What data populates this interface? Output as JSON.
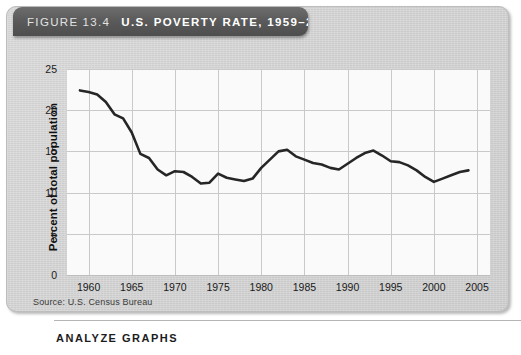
{
  "figure": {
    "label": "FIGURE",
    "number": "13.4",
    "title": "U.S. POVERTY RATE, 1959–2004",
    "source": "Source: U.S. Census Bureau"
  },
  "bottom": {
    "analyze_heading": "ANALYZE GRAPHS"
  },
  "colors": {
    "panel_background": "#d2d2d2",
    "banner_background": "#5b5b5b",
    "plot_background": "#fafafa",
    "grid_line": "#c9c9c9",
    "data_line": "#262626",
    "text": "#1a1a1a"
  },
  "chart_data": {
    "type": "line",
    "title": "U.S. POVERTY RATE, 1959–2004",
    "xlabel": "",
    "ylabel": "Percent of total population",
    "xlim": [
      1957.5,
      2006.5
    ],
    "ylim": [
      0,
      25
    ],
    "yticks": [
      0,
      5,
      10,
      15,
      20,
      25
    ],
    "ytick_labels": [
      "0",
      "5",
      "10",
      "15",
      "20",
      "25"
    ],
    "xticks": [
      1960,
      1965,
      1970,
      1975,
      1980,
      1985,
      1990,
      1995,
      2000,
      2005
    ],
    "xtick_labels": [
      "1960",
      "1965",
      "1970",
      "1975",
      "1980",
      "1985",
      "1990",
      "1995",
      "2000",
      "2005"
    ],
    "grid": true,
    "legend": false,
    "series": [
      {
        "name": "U.S. poverty rate",
        "color": "#262626",
        "x": [
          1959,
          1960,
          1961,
          1962,
          1963,
          1964,
          1965,
          1966,
          1967,
          1968,
          1969,
          1970,
          1971,
          1972,
          1973,
          1974,
          1975,
          1976,
          1977,
          1978,
          1979,
          1980,
          1981,
          1982,
          1983,
          1984,
          1985,
          1986,
          1987,
          1988,
          1989,
          1990,
          1991,
          1992,
          1993,
          1994,
          1995,
          1996,
          1997,
          1998,
          1999,
          2000,
          2001,
          2002,
          2003,
          2004
        ],
        "y": [
          22.4,
          22.2,
          21.9,
          21.0,
          19.5,
          19.0,
          17.3,
          14.7,
          14.2,
          12.8,
          12.1,
          12.6,
          12.5,
          11.9,
          11.1,
          11.2,
          12.3,
          11.8,
          11.6,
          11.4,
          11.7,
          13.0,
          14.0,
          15.0,
          15.2,
          14.4,
          14.0,
          13.6,
          13.4,
          13.0,
          12.8,
          13.5,
          14.2,
          14.8,
          15.1,
          14.5,
          13.8,
          13.7,
          13.3,
          12.7,
          11.9,
          11.3,
          11.7,
          12.1,
          12.5,
          12.7
        ]
      }
    ]
  }
}
